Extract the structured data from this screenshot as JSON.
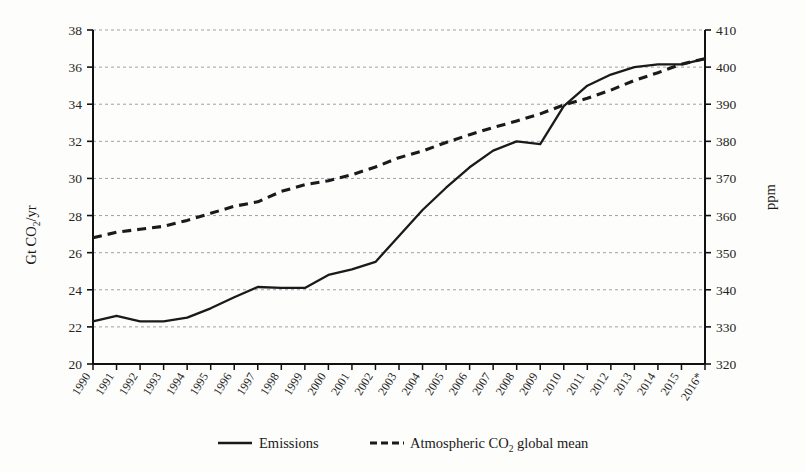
{
  "chart_data": {
    "type": "line",
    "title": "",
    "xlabel": "",
    "ylabel": "Gt CO2/yr",
    "ylabel_parts": {
      "pre": "Gt CO",
      "sub": "2",
      "post": "/yr"
    },
    "y2label": "ppm",
    "ylim": [
      20,
      38
    ],
    "y2lim": [
      320,
      410
    ],
    "yticks": [
      20,
      22,
      24,
      26,
      28,
      30,
      32,
      34,
      36,
      38
    ],
    "y2ticks": [
      320,
      330,
      340,
      350,
      360,
      370,
      380,
      390,
      400,
      410
    ],
    "grid": true,
    "grid_style": "dashed-horizontal",
    "legend_position": "bottom-center",
    "categories": [
      "1990",
      "1991",
      "1992",
      "1993",
      "1994",
      "1995",
      "1996",
      "1997",
      "1998",
      "1999",
      "2000",
      "2001",
      "2002",
      "2003",
      "2004",
      "2005",
      "2006",
      "2007",
      "2008",
      "2009",
      "2010",
      "2011",
      "2012",
      "2013",
      "2014",
      "2015",
      "2016*"
    ],
    "series": [
      {
        "name": "Emissions",
        "axis": "left",
        "unit": "Gt CO2/yr",
        "style": "solid",
        "color": "#1a1a1a",
        "values": [
          22.3,
          22.6,
          22.3,
          22.3,
          22.5,
          23.0,
          23.6,
          24.15,
          24.1,
          24.1,
          24.8,
          25.1,
          25.5,
          26.9,
          28.3,
          29.5,
          30.6,
          31.5,
          32.0,
          31.85,
          33.9,
          35.0,
          35.6,
          36.0,
          36.15,
          36.15,
          36.45
        ]
      },
      {
        "name": "Atmospheric CO2 global mean",
        "axis": "right",
        "unit": "ppm",
        "style": "dashed",
        "color": "#1a1a1a",
        "values": [
          354.0,
          355.5,
          356.3,
          357.1,
          358.7,
          360.6,
          362.5,
          363.7,
          366.5,
          368.3,
          369.4,
          371.0,
          373.1,
          375.6,
          377.4,
          379.7,
          381.8,
          383.7,
          385.5,
          387.4,
          389.8,
          391.6,
          393.8,
          396.4,
          398.5,
          400.8,
          402.3
        ]
      }
    ]
  },
  "legend": {
    "items": [
      {
        "label": "Emissions",
        "style": "solid"
      },
      {
        "label_pre": "Atmospheric CO",
        "label_sub": "2",
        "label_post": " global mean",
        "style": "dashed"
      }
    ]
  },
  "footnote": "*"
}
